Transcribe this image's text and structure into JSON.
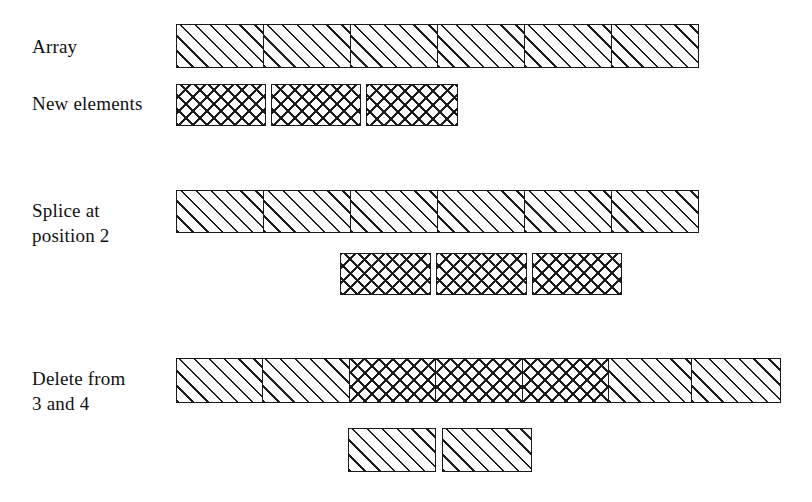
{
  "figure": {
    "background_color": "#ffffff",
    "line_color": "#1a1a1a",
    "fill_color": "#fdfdfd"
  },
  "labels": {
    "array": "Array",
    "new_elements": "New elements",
    "splice_line1": "Splice at",
    "splice_line2": "position 2",
    "delete_line1": "Delete from",
    "delete_line2": "3 and 4"
  },
  "rows": [
    {
      "id": "array-row",
      "label": "Array",
      "cell_count": 6,
      "cells": [
        {
          "pattern": "diagonal"
        },
        {
          "pattern": "diagonal"
        },
        {
          "pattern": "diagonal"
        },
        {
          "pattern": "diagonal"
        },
        {
          "pattern": "diagonal"
        },
        {
          "pattern": "diagonal"
        }
      ]
    },
    {
      "id": "new-elements-row",
      "label": "New elements",
      "cell_count": 3,
      "detached": true,
      "cells": [
        {
          "pattern": "crosshatch"
        },
        {
          "pattern": "crosshatch"
        },
        {
          "pattern": "crosshatch"
        }
      ]
    },
    {
      "id": "splice-array-row",
      "label": "Splice at position 2",
      "cell_count": 6,
      "cells": [
        {
          "pattern": "diagonal"
        },
        {
          "pattern": "diagonal"
        },
        {
          "pattern": "diagonal"
        },
        {
          "pattern": "diagonal"
        },
        {
          "pattern": "diagonal"
        },
        {
          "pattern": "diagonal"
        }
      ]
    },
    {
      "id": "splice-inserted-row",
      "label": "inserted elements",
      "cell_count": 3,
      "detached": true,
      "cells": [
        {
          "pattern": "crosshatch"
        },
        {
          "pattern": "crosshatch"
        },
        {
          "pattern": "crosshatch"
        }
      ]
    },
    {
      "id": "delete-array-row",
      "label": "Delete from 3 and 4",
      "cell_count": 7,
      "cells": [
        {
          "pattern": "diagonal"
        },
        {
          "pattern": "diagonal"
        },
        {
          "pattern": "crosshatch"
        },
        {
          "pattern": "crosshatch"
        },
        {
          "pattern": "crosshatch"
        },
        {
          "pattern": "diagonal"
        },
        {
          "pattern": "diagonal"
        }
      ]
    },
    {
      "id": "deleted-row",
      "label": "removed elements",
      "cell_count": 2,
      "detached": true,
      "cells": [
        {
          "pattern": "diagonal"
        },
        {
          "pattern": "diagonal"
        }
      ]
    }
  ]
}
